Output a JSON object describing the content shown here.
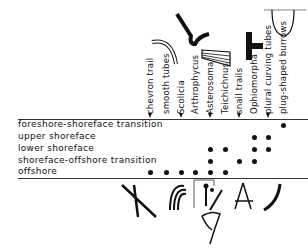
{
  "diagram": {
    "type": "trace-fossil distribution chart",
    "columns": [
      {
        "label": "chevron trail",
        "x": 150
      },
      {
        "label": "smooth tubes",
        "x": 166
      },
      {
        "label": "Scolicia",
        "x": 181
      },
      {
        "label": "Arthrophycus",
        "x": 195
      },
      {
        "label": "Asterosoma",
        "x": 210
      },
      {
        "label": "Teichichnus",
        "x": 225
      },
      {
        "label": "snail trails",
        "x": 239
      },
      {
        "label": "Ophiomorpha",
        "x": 254
      },
      {
        "label": "plural curving tubes",
        "x": 268
      },
      {
        "label": "plug-shaped burrows",
        "x": 283
      }
    ],
    "rows": [
      {
        "label": "foreshore-shoreface transition",
        "y": 125,
        "dots": [
          9
        ]
      },
      {
        "label": "upper shoreface",
        "y": 137,
        "dots": [
          7,
          8
        ]
      },
      {
        "label": "lower shoreface",
        "y": 149,
        "dots": [
          4,
          5,
          7,
          8
        ]
      },
      {
        "label": "shoreface-offshore transition",
        "y": 161,
        "dots": [
          4,
          6,
          7
        ]
      },
      {
        "label": "offshore",
        "y": 172,
        "dots": [
          0,
          1,
          2,
          3,
          4,
          5
        ]
      }
    ],
    "ink_color": "#111111"
  }
}
